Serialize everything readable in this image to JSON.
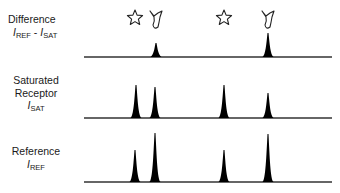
{
  "diagram": {
    "type": "spectra-comparison",
    "rows": [
      {
        "id": "difference",
        "title": "Difference",
        "formula": {
          "a": "I",
          "a_sub": "REF",
          "op": " - ",
          "b": "I",
          "b_sub": "SAT"
        },
        "baseline_y": 57,
        "peaks": [
          {
            "x": 156,
            "height": 14
          },
          {
            "x": 268,
            "height": 24
          }
        ],
        "annotations": [
          {
            "symbol": "star",
            "x": 135,
            "y": 18
          },
          {
            "symbol": "ligand",
            "x": 156,
            "y": 19
          },
          {
            "symbol": "star",
            "x": 224,
            "y": 18
          },
          {
            "symbol": "ligand",
            "x": 268,
            "y": 19
          }
        ]
      },
      {
        "id": "saturated",
        "title_line1": "Saturated",
        "title_line2": "Receptor",
        "symbol": {
          "a": "I",
          "a_sub": "SAT"
        },
        "baseline_y": 118,
        "peaks": [
          {
            "x": 136,
            "height": 33
          },
          {
            "x": 155,
            "height": 31
          },
          {
            "x": 224,
            "height": 33
          },
          {
            "x": 268,
            "height": 25
          }
        ]
      },
      {
        "id": "reference",
        "title": "Reference",
        "symbol": {
          "a": "I",
          "a_sub": "REF"
        },
        "baseline_y": 182,
        "peaks": [
          {
            "x": 135,
            "height": 32
          },
          {
            "x": 155,
            "height": 49
          },
          {
            "x": 224,
            "height": 32
          },
          {
            "x": 268,
            "height": 48
          }
        ]
      }
    ],
    "baseline_x_start": 84,
    "baseline_x_end": 332,
    "colors": {
      "line": "#333333",
      "peak": "#000000",
      "symbol_stroke": "#222222"
    }
  }
}
